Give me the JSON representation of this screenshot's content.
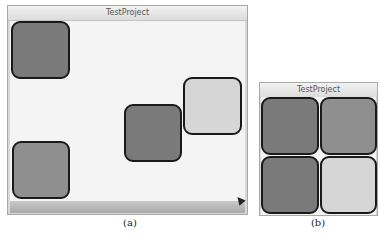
{
  "windows": [
    {
      "id": "a",
      "title": "TestProject",
      "caption": "(a)",
      "tiles": [
        {
          "shade": "dark",
          "label": "tile-1"
        },
        {
          "shade": "dark",
          "label": "tile-2"
        },
        {
          "shade": "light",
          "label": "tile-3"
        },
        {
          "shade": "mid",
          "label": "tile-4"
        }
      ]
    },
    {
      "id": "b",
      "title": "TestProject",
      "caption": "(b)",
      "tiles": [
        {
          "shade": "dark",
          "label": "tile-1"
        },
        {
          "shade": "mid",
          "label": "tile-2"
        },
        {
          "shade": "dark",
          "label": "tile-3"
        },
        {
          "shade": "light",
          "label": "tile-4"
        }
      ]
    }
  ],
  "colors": {
    "dark": "#7a7a7a",
    "mid": "#8f8f8f",
    "light": "#d6d6d6",
    "border": "#1a1a1a"
  }
}
